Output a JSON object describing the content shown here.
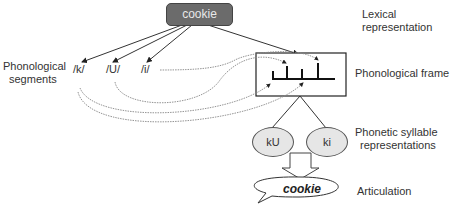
{
  "diagram": {
    "lexical_node": "cookie",
    "labels": {
      "lexical": "Lexical representation",
      "segments_line1": "Phonological",
      "segments_line2": "segments",
      "frame": "Phonological frame",
      "syllable_line1": "Phonetic syllable",
      "syllable_line2": "representations",
      "articulation": "Articulation"
    },
    "segments": [
      "/k/",
      "/U/",
      "/i/"
    ],
    "syllables": [
      "kU",
      "ki"
    ],
    "articulation_word": "cookie",
    "colors": {
      "lexical_fill": "#6b6b6b",
      "syllable_fill": "#e6e6e6",
      "line": "#333333",
      "dotted": "#777777"
    }
  }
}
